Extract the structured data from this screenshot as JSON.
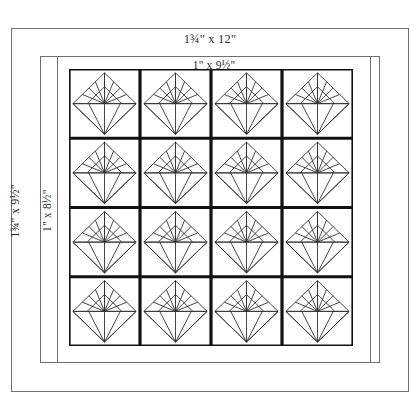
{
  "diagram": {
    "type": "quilt-block-layout",
    "labels": {
      "top_outer": "1¾\" x 12\"",
      "top_inner": "1\" x 9½\"",
      "left_outer": "1¾\" x 9½\"",
      "left_inner": "1\" x 8½\""
    },
    "grid": {
      "columns": 4,
      "rows": 4,
      "block_count": 16,
      "block_motif": "fan-diamond"
    },
    "colors": {
      "background": "#ffffff",
      "frame_line": "#6f6f6f",
      "grid_line": "#111111",
      "motif_line": "#333333"
    }
  }
}
